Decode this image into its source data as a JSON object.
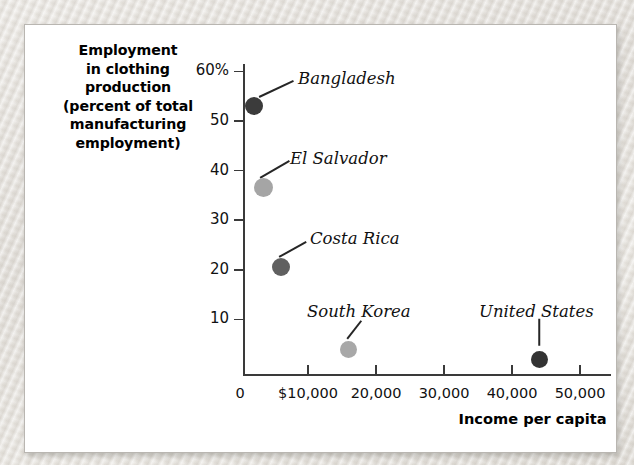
{
  "chart_data": {
    "type": "scatter",
    "title": "",
    "ylabel_lines": [
      "Employment",
      "in clothing",
      "production",
      "(percent of total",
      "manufacturing",
      "employment)"
    ],
    "ylabel": "Employment in clothing production (percent of total manufacturing employment)",
    "xlabel": "Income per capita",
    "ylim": [
      0,
      60
    ],
    "xlim": [
      0,
      55000
    ],
    "yticks": [
      10,
      20,
      30,
      40,
      50,
      60
    ],
    "ytick_labels": [
      "10",
      "20",
      "30",
      "40",
      "50",
      "60%"
    ],
    "xticks": [
      0,
      10000,
      20000,
      30000,
      40000,
      50000
    ],
    "xtick_labels": [
      "0",
      "$10,000",
      "20,000",
      "30,000",
      "40,000",
      "50,000"
    ],
    "grid": false,
    "legend": "none",
    "points": [
      {
        "name": "Bangladesh",
        "x": 2000,
        "y": 53.0,
        "color": "#3b3b3b",
        "radius": 9.0,
        "label_x": 297,
        "label_y": 68,
        "leader_from_x": 258,
        "leader_from_y": 96,
        "leader_to_x": 292,
        "leader_to_y": 80
      },
      {
        "name": "El Salvador",
        "x": 3500,
        "y": 36.5,
        "color": "#a5a5a5",
        "radius": 9.5,
        "label_x": 289,
        "label_y": 148,
        "leader_from_x": 259,
        "leader_from_y": 177,
        "leader_to_x": 288,
        "leader_to_y": 160
      },
      {
        "name": "Costa Rica",
        "x": 6000,
        "y": 20.5,
        "color": "#606060",
        "radius": 9.0,
        "label_x": 309,
        "label_y": 228,
        "leader_from_x": 278,
        "leader_from_y": 256,
        "leader_to_x": 305,
        "leader_to_y": 241
      },
      {
        "name": "South Korea",
        "x": 16000,
        "y": 4.0,
        "color": "#a8a8a8",
        "radius": 8.5,
        "label_x": 306,
        "label_y": 301,
        "leader_from_x": 346,
        "leader_from_y": 338,
        "leader_to_x": 360,
        "leader_to_y": 320
      },
      {
        "name": "United States",
        "x": 44000,
        "y": 2.0,
        "color": "#333333",
        "radius": 8.5,
        "label_x": 478,
        "label_y": 301,
        "leader_from_x": 538,
        "leader_from_y": 345,
        "leader_to_x": 538,
        "leader_to_y": 318
      }
    ]
  },
  "axes": {
    "origin_x": 242,
    "origin_y": 373,
    "y_zero_px": 368,
    "y_unit_px": 4.96,
    "x_zero_px": 239,
    "x_unit_px": 0.0068,
    "axis_color": "#3a3a3a"
  }
}
